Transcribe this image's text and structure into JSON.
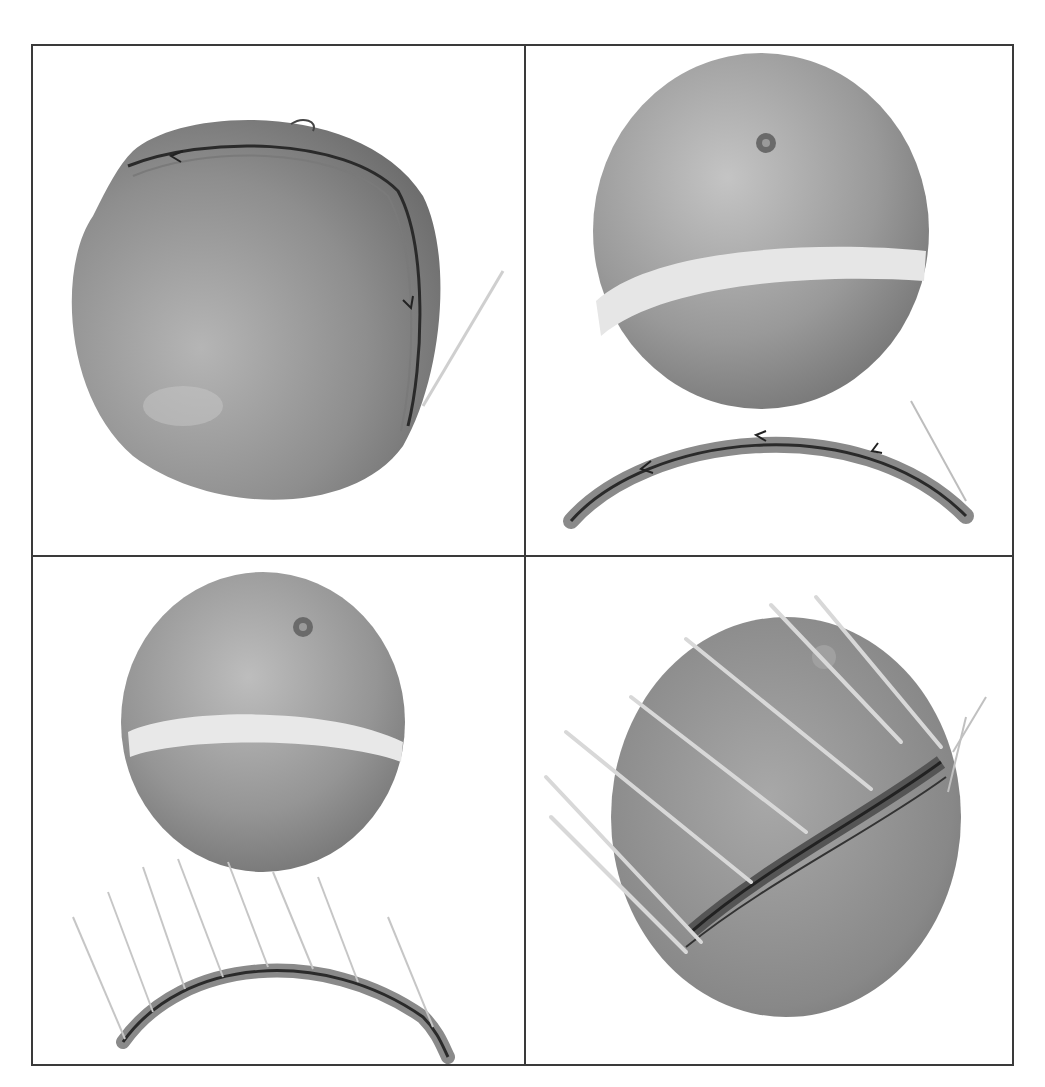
{
  "figure": {
    "layout": "2x2 grid of grayscale photographs",
    "frame_color": "#3a3a3a",
    "background": "#ffffff",
    "panels": [
      {
        "position": "top-left",
        "caption": "Grapefruit with a marked strip of peel drawn around it, arrows indicating direction"
      },
      {
        "position": "top-right",
        "caption": "Grapefruit with peel strip removed, the strip laid below as an arc with arrows"
      },
      {
        "position": "bottom-left",
        "caption": "Grapefruit with peel strip removed; strip below pierced with toothpicks"
      },
      {
        "position": "bottom-right",
        "caption": "Peel strip reattached to grapefruit and fixed with toothpicks"
      }
    ]
  }
}
